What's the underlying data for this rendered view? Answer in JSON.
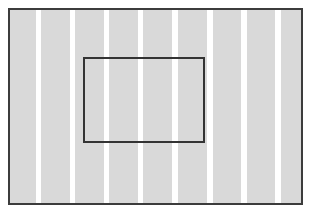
{
  "diagram": {
    "canvas": {
      "width": 309,
      "height": 210,
      "background": "#ffffff"
    },
    "outer_frame": {
      "x": 8,
      "y": 8,
      "width": 295,
      "height": 197,
      "border_color": "#3c3c3c",
      "border_width": 2
    },
    "stripes": {
      "color": "#d9d9d9",
      "gap_color": "#ffffff",
      "count": 9,
      "items": [
        {
          "x": 0,
          "width": 26
        },
        {
          "x": 31,
          "width": 29
        },
        {
          "x": 65,
          "width": 29
        },
        {
          "x": 99,
          "width": 29
        },
        {
          "x": 133,
          "width": 29
        },
        {
          "x": 168,
          "width": 29
        },
        {
          "x": 203,
          "width": 28
        },
        {
          "x": 237,
          "width": 28
        },
        {
          "x": 271,
          "width": 24
        }
      ]
    },
    "inner_rect": {
      "x": 83,
      "y": 57,
      "width": 122,
      "height": 86,
      "border_color": "#333333",
      "border_width": 2,
      "fill": "transparent"
    }
  }
}
